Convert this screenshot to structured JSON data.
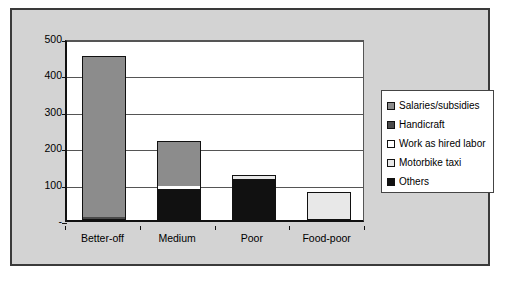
{
  "chart_data": {
    "type": "bar",
    "subtype": "stacked-column",
    "title": "",
    "xlabel": "",
    "ylabel": "",
    "categories": [
      "Better-off",
      "Medium",
      "Poor",
      "Food-poor"
    ],
    "ylim": [
      0,
      500
    ],
    "yticks": [
      0,
      100,
      200,
      300,
      400,
      500
    ],
    "ytick_labels": [
      "-",
      "100",
      "200",
      "300",
      "400",
      "500"
    ],
    "grid": true,
    "legend_position": "right",
    "series": [
      {
        "name": "Others",
        "color": "#111111",
        "values": [
          0,
          85,
          113,
          0
        ]
      },
      {
        "name": "Motorbike taxi",
        "color": "#e8e8e8",
        "values": [
          0,
          0,
          10,
          78
        ]
      },
      {
        "name": "Work as hired labor",
        "color": "#ffffff",
        "values": [
          0,
          8,
          0,
          0
        ]
      },
      {
        "name": "Handicraft",
        "color": "#4a4a4a",
        "values": [
          8,
          0,
          0,
          0
        ]
      },
      {
        "name": "Salaries/subsidies",
        "color": "#8c8c8c",
        "values": [
          443,
          125,
          0,
          0
        ]
      }
    ],
    "totals": [
      451,
      218,
      123,
      78
    ]
  },
  "legend": {
    "entries": [
      {
        "label": "Salaries/subsidies",
        "color": "#8c8c8c"
      },
      {
        "label": "Handicraft",
        "color": "#4a4a4a"
      },
      {
        "label": "Work as hired labor",
        "color": "#ffffff"
      },
      {
        "label": "Motorbike taxi",
        "color": "#e8e8e8"
      },
      {
        "label": "Others",
        "color": "#111111"
      }
    ]
  },
  "axis": {
    "y_labels": [
      "500",
      "400",
      "300",
      "200",
      "100",
      "-"
    ],
    "x_labels": [
      "Better-off",
      "Medium",
      "Poor",
      "Food-poor"
    ]
  },
  "colors": {
    "frame_background": "#d3d3d3",
    "plot_background": "#ffffff",
    "axis": "#111111",
    "gridline": "#555555"
  }
}
